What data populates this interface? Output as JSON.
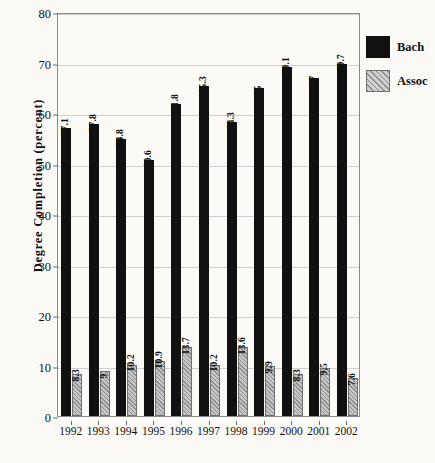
{
  "chart_data": {
    "type": "bar",
    "title": "",
    "xlabel": "",
    "ylabel": "Degree Completion (percent)",
    "ylim": [
      0,
      80
    ],
    "ytick_labels": [
      "0",
      "10",
      "20",
      "30",
      "40",
      "50",
      "60",
      "70",
      "80"
    ],
    "ytick_values": [
      0,
      10,
      20,
      30,
      40,
      50,
      60,
      70,
      80
    ],
    "grid": true,
    "legend_position": "right",
    "categories": [
      "1992",
      "1993",
      "1994",
      "1995",
      "1996",
      "1997",
      "1998",
      "1999",
      "2000",
      "2001",
      "2002"
    ],
    "series": [
      {
        "name": "Bach",
        "color": "#111111",
        "values": [
          57.1,
          57.8,
          54.8,
          50.6,
          61.8,
          65.3,
          58.3,
          65,
          69.1,
          67,
          69.7
        ],
        "labels": [
          "57.1",
          "57.8",
          "54.8",
          "50.6",
          "61.8",
          "65.3",
          "58.3",
          "65",
          "69.1",
          "67",
          "69.7"
        ]
      },
      {
        "name": "Assoc",
        "color": "#9a9a9a",
        "values": [
          8.3,
          9,
          10.2,
          10.9,
          13.7,
          10.2,
          13.6,
          9.9,
          8.3,
          9.5,
          7.6
        ],
        "labels": [
          "8.3",
          "9",
          "10.2",
          "10.9",
          "13.7",
          "10.2",
          "13.6",
          "9.9",
          "8.3",
          "9.5",
          "7.6"
        ]
      }
    ]
  },
  "legend": {
    "items": [
      {
        "label": "Bach",
        "swatch": "solid-black-swatch"
      },
      {
        "label": "Assoc",
        "swatch": "hatched-gray-swatch"
      }
    ]
  }
}
